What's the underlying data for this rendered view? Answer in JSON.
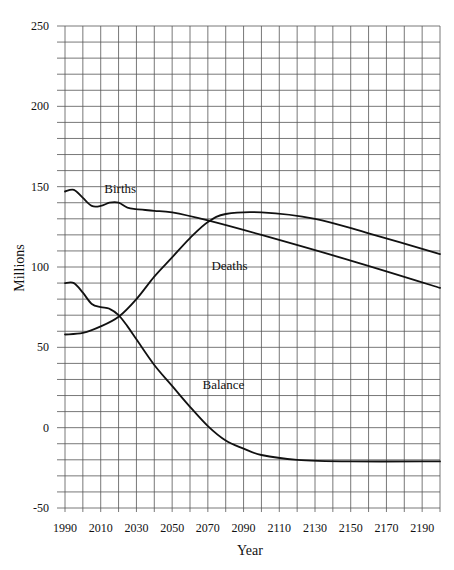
{
  "chart_data": {
    "type": "line",
    "title": "",
    "xlabel": "Year",
    "ylabel": "Millions",
    "xlim": [
      1990,
      2200
    ],
    "ylim": [
      -50,
      250
    ],
    "grid": true,
    "x_ticks": [
      "1990",
      "2010",
      "2030",
      "2050",
      "2070",
      "2090",
      "2110",
      "2130",
      "2150",
      "2170",
      "2190"
    ],
    "y_ticks": [
      "250",
      "200",
      "150",
      "100",
      "50",
      "0",
      "-50"
    ],
    "legend": "inline labels",
    "series": [
      {
        "name": "Births",
        "label_pos": {
          "year": 2012,
          "value": 146
        },
        "x": [
          1990,
          1995,
          2000,
          2005,
          2010,
          2015,
          2020,
          2025,
          2030,
          2040,
          2050,
          2070,
          2100,
          2150,
          2200
        ],
        "values": [
          147,
          148,
          143,
          138,
          138,
          140,
          140,
          137,
          136,
          135,
          134,
          129,
          120,
          104,
          87
        ]
      },
      {
        "name": "Deaths",
        "label_pos": {
          "year": 2072,
          "value": 98
        },
        "x": [
          1990,
          2000,
          2010,
          2020,
          2030,
          2040,
          2050,
          2060,
          2070,
          2080,
          2100,
          2130,
          2160,
          2200
        ],
        "values": [
          58,
          59,
          63,
          69,
          80,
          94,
          106,
          118,
          128,
          133,
          134,
          130,
          121,
          108
        ]
      },
      {
        "name": "Balance",
        "label_pos": {
          "year": 2067,
          "value": 24
        },
        "x": [
          1990,
          1995,
          2000,
          2005,
          2010,
          2015,
          2020,
          2025,
          2030,
          2040,
          2050,
          2060,
          2070,
          2080,
          2090,
          2100,
          2120,
          2150,
          2200
        ],
        "values": [
          90,
          90,
          84,
          77,
          75,
          74,
          70,
          63,
          55,
          39,
          26,
          13,
          1,
          -8,
          -13,
          -17,
          -20,
          -21,
          -21
        ]
      }
    ]
  }
}
